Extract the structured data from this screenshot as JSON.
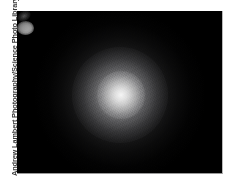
{
  "photo": {
    "credit": "Andrew Lambert Photography/Science Photo Library",
    "background_color": "#000000",
    "canvas_color": "#ffffff",
    "border_color": "#b9b9b9",
    "subject": "planetary-nebula-glow"
  },
  "icons": {
    "nebula_core": "bright-star-core",
    "nebula_disc": "circular-nebula-disc",
    "nebula_halo": "outer-halo",
    "companion_knot": "faint-companion-knot"
  }
}
